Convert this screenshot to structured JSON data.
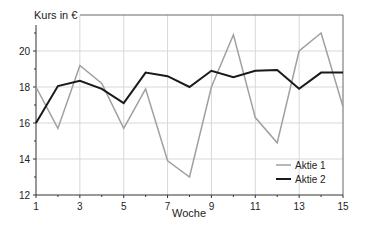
{
  "chart_data": {
    "type": "line",
    "title": "",
    "xlabel": "Woche",
    "ylabel": "Kurs in €",
    "x": [
      1,
      2,
      3,
      4,
      5,
      6,
      7,
      8,
      9,
      10,
      11,
      12,
      13,
      14,
      15
    ],
    "x_tick_labels": [
      "1",
      "3",
      "5",
      "7",
      "9",
      "11",
      "13",
      "15"
    ],
    "y_tick_labels": [
      "12",
      "14",
      "16",
      "18",
      "20"
    ],
    "xlim": [
      1,
      15
    ],
    "ylim": [
      12,
      22
    ],
    "grid": true,
    "legend_position": "lower right",
    "series": [
      {
        "name": "Aktie 1",
        "color": "#a0a0a0",
        "values": [
          18.0,
          15.7,
          19.2,
          18.2,
          15.7,
          17.9,
          13.9,
          13.0,
          18.0,
          20.9,
          16.3,
          14.9,
          20.0,
          21.0,
          16.9
        ]
      },
      {
        "name": "Aktie 2",
        "color": "#1a1a1a",
        "values": [
          16.0,
          18.05,
          18.35,
          17.9,
          17.1,
          18.8,
          18.6,
          18.0,
          18.9,
          18.55,
          18.9,
          18.95,
          17.9,
          18.8,
          18.8
        ]
      }
    ]
  },
  "axis": {
    "y_title": "Kurs in €",
    "x_title": "Woche"
  },
  "legend": {
    "items": [
      {
        "label": "Aktie 1"
      },
      {
        "label": "Aktie 2"
      }
    ]
  }
}
